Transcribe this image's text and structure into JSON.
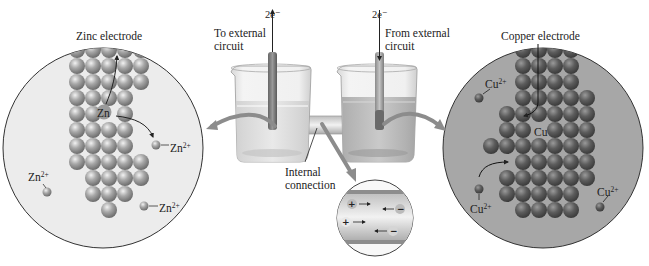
{
  "diagram": {
    "type": "galvanic-cell-zinc-copper",
    "left_panel": {
      "title": "Zinc electrode",
      "atom_label": "Zn",
      "ion_labels": [
        {
          "base": "Zn",
          "charge": "2+"
        },
        {
          "base": "Zn",
          "charge": "2+"
        },
        {
          "base": "Zn",
          "charge": "2+"
        }
      ],
      "background_color": "#eaeaea"
    },
    "right_panel": {
      "title": "Copper electrode",
      "atom_label": "Cu",
      "ion_labels": [
        {
          "base": "Cu",
          "charge": "2+"
        },
        {
          "base": "Cu",
          "charge": "2+"
        },
        {
          "base": "Cu",
          "charge": "2+"
        }
      ],
      "background_color": "#a9a9a9"
    },
    "center": {
      "left_electron_label": "2e⁻",
      "right_electron_label": "2e⁻",
      "left_circuit_label_line1": "To external",
      "left_circuit_label_line2": "circuit",
      "right_circuit_label_line1": "From external",
      "right_circuit_label_line2": "circuit",
      "connection_label_line1": "Internal",
      "connection_label_line2": "connection"
    },
    "inset": {
      "positive_symbol": "+",
      "negative_symbol": "−"
    }
  }
}
